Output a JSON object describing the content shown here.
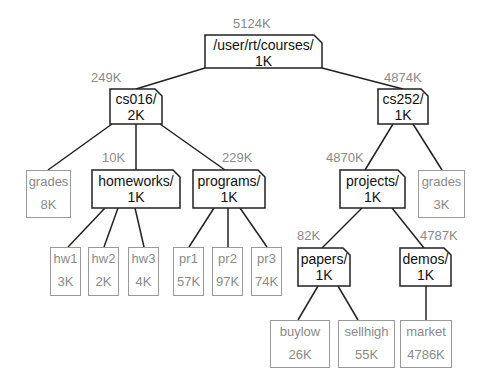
{
  "tree": {
    "root": {
      "name": "/user/rt/courses/",
      "size": "1K",
      "total": "5124K"
    },
    "cs016": {
      "name": "cs016/",
      "size": "2K",
      "total": "249K"
    },
    "cs252": {
      "name": "cs252/",
      "size": "1K",
      "total": "4874K"
    },
    "homeworks": {
      "name": "homeworks/",
      "size": "1K",
      "total": "10K"
    },
    "programs": {
      "name": "programs/",
      "size": "1K",
      "total": "229K"
    },
    "projects": {
      "name": "projects/",
      "size": "1K",
      "total": "4870K"
    },
    "papers": {
      "name": "papers/",
      "size": "1K",
      "total": "82K"
    },
    "demos": {
      "name": "demos/",
      "size": "1K",
      "total": "4787K"
    },
    "files": {
      "grades_cs016": {
        "name": "grades",
        "size": "8K"
      },
      "hw1": {
        "name": "hw1",
        "size": "3K"
      },
      "hw2": {
        "name": "hw2",
        "size": "2K"
      },
      "hw3": {
        "name": "hw3",
        "size": "4K"
      },
      "pr1": {
        "name": "pr1",
        "size": "57K"
      },
      "pr2": {
        "name": "pr2",
        "size": "97K"
      },
      "pr3": {
        "name": "pr3",
        "size": "74K"
      },
      "grades_cs252": {
        "name": "grades",
        "size": "3K"
      },
      "buylow": {
        "name": "buylow",
        "size": "26K"
      },
      "sellhigh": {
        "name": "sellhigh",
        "size": "55K"
      },
      "market": {
        "name": "market",
        "size": "4786K"
      }
    }
  }
}
